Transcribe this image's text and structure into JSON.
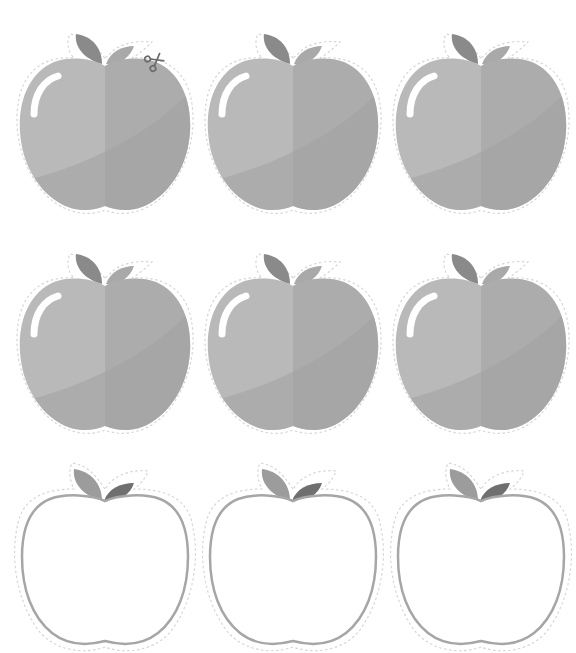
{
  "sheet": {
    "title": "Apple cutout templates",
    "rows": 3,
    "columns": 3
  },
  "colors": {
    "background": "#ffffff",
    "body_light": "#b9b9b9",
    "body_right": "#acacac",
    "body_shadow": "#a2a2a2",
    "highlight": "#ffffff",
    "leaf_left": "#8a8a8a",
    "leaf_right_filled": "#a9a9a9",
    "leaf_right_outline": "#6f6f6f",
    "leaf_left_outline": "#9c9c9c",
    "outline_stroke": "#a6a6a6",
    "cut_line": "#d6d6d6"
  },
  "apples": [
    {
      "id": "apple-1",
      "style": "filled",
      "x": 10,
      "y": 22,
      "has_scissors": true
    },
    {
      "id": "apple-2",
      "style": "filled",
      "x": 198,
      "y": 22,
      "has_scissors": false
    },
    {
      "id": "apple-3",
      "style": "filled",
      "x": 386,
      "y": 22,
      "has_scissors": false
    },
    {
      "id": "apple-4",
      "style": "filled",
      "x": 10,
      "y": 242,
      "has_scissors": false
    },
    {
      "id": "apple-5",
      "style": "filled",
      "x": 198,
      "y": 242,
      "has_scissors": false
    },
    {
      "id": "apple-6",
      "style": "filled",
      "x": 386,
      "y": 242,
      "has_scissors": false
    },
    {
      "id": "apple-7",
      "style": "outline",
      "x": 10,
      "y": 457,
      "has_scissors": false
    },
    {
      "id": "apple-8",
      "style": "outline",
      "x": 198,
      "y": 457,
      "has_scissors": false
    },
    {
      "id": "apple-9",
      "style": "outline",
      "x": 386,
      "y": 457,
      "has_scissors": false
    }
  ],
  "scissors": {
    "icon": "scissors-icon",
    "x": 144,
    "y": 50
  }
}
